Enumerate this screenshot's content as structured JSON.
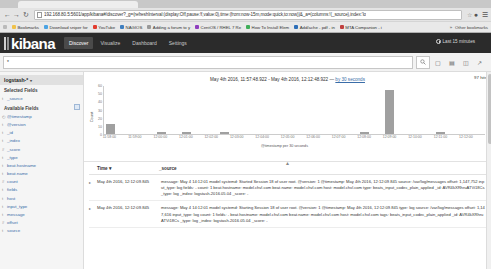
{
  "browser": {
    "url": "192.168.80.5:5601/app/kibana#/discover?_g=(refreshInterval:(display:Off,pause:!f,value:0),time:(from:now-15m,mode:quick,to:now))&_a=(columns:!(_source),index:'lo",
    "back_icon": "back-arrow-icon",
    "forward_icon": "forward-arrow-icon",
    "reload_icon": "reload-icon",
    "star_icon": "bookmark-star-icon",
    "menu_icon": "hamburger-menu-icon",
    "profile_icon": "profile-icon",
    "bookmarks_label": "Bookmarks",
    "bookmarks": [
      {
        "label": "Bookmarks",
        "color": "#f0c24b"
      },
      {
        "label": "Download sniper for",
        "color": "#4ba3e3"
      },
      {
        "label": "YouTube",
        "color": "#e23b2e"
      },
      {
        "label": "NAGIOS",
        "color": "#3f7fbf"
      },
      {
        "label": "Adding a forum to y",
        "color": "#999999"
      },
      {
        "label": "CentOS / RHEL 7 Re",
        "color": "#8f3fbf"
      },
      {
        "label": "How To Install Elem",
        "color": "#3fae5a"
      },
      {
        "label": "Add/ache - pdf - in",
        "color": "#2e6fb8"
      },
      {
        "label": "MTA Companion - i",
        "color": "#c04040"
      }
    ],
    "bookmarks_overflow": "Other bookmarks"
  },
  "kibana": {
    "logo": "kibana",
    "tabs": [
      {
        "label": "Discover",
        "active": true
      },
      {
        "label": "Visualize",
        "active": false
      },
      {
        "label": "Dashboard",
        "active": false
      },
      {
        "label": "Settings",
        "active": false
      }
    ],
    "time_picker": {
      "icon": "clock-icon",
      "label": "Last 15 minutes"
    }
  },
  "query": {
    "value": "*",
    "placeholder": "Search...",
    "search_icon": "magnifier-icon",
    "actions": [
      {
        "name": "new-search-icon",
        "glyph": "⬚"
      },
      {
        "name": "save-search-icon",
        "glyph": "▤"
      },
      {
        "name": "open-search-icon",
        "glyph": "☰"
      },
      {
        "name": "share-search-icon",
        "glyph": "↗"
      }
    ]
  },
  "sidebar": {
    "index_pattern": "logstash-*",
    "caret_icon": "chevron-down-icon",
    "selected_fields_label": "Selected Fields",
    "selected_fields": [
      {
        "name": "_source",
        "type": "t"
      }
    ],
    "available_fields_label": "Available Fields",
    "available_fields": [
      {
        "name": "@timestamp",
        "type": "date"
      },
      {
        "name": "@version",
        "type": "t"
      },
      {
        "name": "_id",
        "type": "t"
      },
      {
        "name": "_index",
        "type": "t"
      },
      {
        "name": "_score",
        "type": "num"
      },
      {
        "name": "_type",
        "type": "t"
      },
      {
        "name": "beat.hostname",
        "type": "t"
      },
      {
        "name": "beat.name",
        "type": "t"
      },
      {
        "name": "count",
        "type": "num"
      },
      {
        "name": "fields",
        "type": "t"
      },
      {
        "name": "host",
        "type": "t"
      },
      {
        "name": "input_type",
        "type": "t"
      },
      {
        "name": "message",
        "type": "t"
      },
      {
        "name": "offset",
        "type": "num"
      },
      {
        "name": "source",
        "type": "t"
      }
    ]
  },
  "chart_panel": {
    "hits": "97 hits",
    "time_range_text": "May 4th 2016, 11:57:48.922 - May 4th 2016, 12:12:48.922",
    "interval_prefix": "—",
    "interval_link": "by 30 seconds",
    "collapse_icon": "chevron-up-icon"
  },
  "chart_data": {
    "type": "bar",
    "title": "",
    "xlabel": "@timestamp per 30 seconds",
    "ylabel": "Count",
    "ylim": [
      0,
      60
    ],
    "yticks": [
      0,
      10,
      20,
      30,
      40,
      50,
      60
    ],
    "grid": false,
    "legend": "none",
    "categories": [
      "11:58:00",
      "11:58:30",
      "11:59:00",
      "11:59:30",
      "12:00:00",
      "12:00:30",
      "12:01:00",
      "12:01:30",
      "12:02:00",
      "12:02:30",
      "12:03:00",
      "12:03:30",
      "12:04:00",
      "12:04:30",
      "12:05:00",
      "12:05:30",
      "12:06:00",
      "12:06:30",
      "12:07:00",
      "12:07:30",
      "12:08:00",
      "12:08:30",
      "12:09:00",
      "12:09:30",
      "12:10:00",
      "12:10:30",
      "12:11:00",
      "12:11:30",
      "12:12:00",
      "12:12:30"
    ],
    "values": [
      12,
      0,
      0,
      0,
      2,
      0,
      2,
      0,
      0,
      2,
      0,
      0,
      0,
      0,
      0,
      0,
      0,
      0,
      0,
      0,
      2,
      0,
      55,
      0,
      0,
      0,
      2,
      0,
      0,
      0
    ],
    "xtick_labels": [
      "11:58:00",
      "11:59:00",
      "12:00:00",
      "12:01:00",
      "12:02:00",
      "12:03:00",
      "12:04:00",
      "12:05:00",
      "12:06:00",
      "12:07:00",
      "12:08:00",
      "12:09:00",
      "12:10:00",
      "12:11:00",
      "12:12:00"
    ]
  },
  "doc_table": {
    "columns": [
      {
        "label": "Time",
        "sort_icon": "sort-arrow-icon"
      },
      {
        "label": "_source"
      }
    ],
    "rows": [
      {
        "expand_icon": "expand-caret-icon",
        "time": "May 4th 2016, 12:12:09.845",
        "source": "message: May 4 14:12:01 model systemd: Started Session 18 of user root. @version: 1 @timestamp: May 4th 2016, 12:12:09.845 source: /var/log/messages offset: 1,147,752 input_type: log fields:  -  count: 1 beat.hostname: model.chvl.com beat.name: model.chvl.com host: model.chvl.com type: beats_input_codec_plain_applied _id: AVR4kXRhruATVi18Cs _type: log _index: logstash-2016.05.04 _score:  -"
      },
      {
        "expand_icon": "expand-caret-icon",
        "time": "May 4th 2016, 12:12:09.845",
        "source": "message: May 4 14:12:01 model systemd: Starting Session 18 of user root. @version: 1 @timestamp: May 4th 2016, 12:12:09.845 type: log source: /var/log/messages offset: 1,147,616 input_type: log count: 1 fields:  -  beat.hostname: model.chvl.com beat.name: model.chvl.com host: model.chvl.com tags: beats_input_codec_plain_applied _id: AVR4kXRhruATVi18Cs _type: log _index: logstash-2016.05.04 _score:  -"
      }
    ]
  }
}
